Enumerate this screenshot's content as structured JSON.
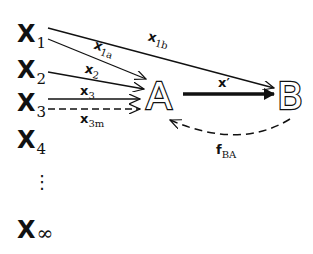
{
  "diagram": {
    "inputs": [
      {
        "base": "X",
        "sub": "1"
      },
      {
        "base": "X",
        "sub": "2"
      },
      {
        "base": "X",
        "sub": "3"
      },
      {
        "base": "X",
        "sub": "4"
      },
      {
        "base": "X",
        "sub": "∞"
      }
    ],
    "ellipsis": "⋮",
    "nodes": {
      "a": "A",
      "b": "B"
    },
    "edges": [
      {
        "base": "x",
        "sub": "1b",
        "from": "X1",
        "to": "B",
        "style": "solid"
      },
      {
        "base": "x",
        "sub": "1a",
        "from": "X1",
        "to": "A",
        "style": "solid"
      },
      {
        "base": "x",
        "sub": "2",
        "from": "X2",
        "to": "A",
        "style": "solid"
      },
      {
        "base": "x",
        "sub": "3",
        "from": "X3",
        "to": "A",
        "style": "solid"
      },
      {
        "base": "x",
        "sub": "3m",
        "from": "X3",
        "to": "A",
        "style": "dashed"
      },
      {
        "base": "x′",
        "sub": "",
        "from": "A",
        "to": "B",
        "style": "thick"
      },
      {
        "base": "f",
        "sub": "BA",
        "from": "B",
        "to": "A",
        "style": "dashed-curve"
      }
    ],
    "colors": {
      "ink": "#111111",
      "background": "#ffffff"
    }
  }
}
